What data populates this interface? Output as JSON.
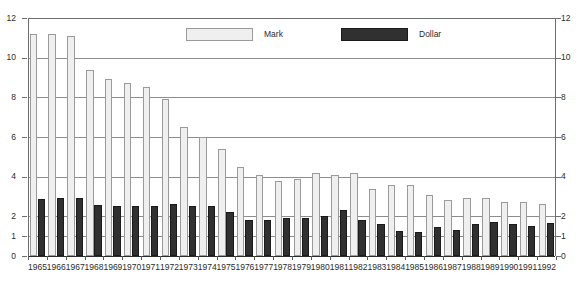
{
  "chart_data": {
    "type": "bar",
    "title": "",
    "subtitle": "",
    "xlabel": "",
    "ylabel": "",
    "ylim": [
      0,
      12
    ],
    "grid": true,
    "legend_position": "top-center",
    "y_ticks": [
      "0",
      "1",
      "2",
      "4",
      "6",
      "8",
      "10",
      "12"
    ],
    "y_tick_values": [
      0,
      1,
      2,
      4,
      6,
      8,
      10,
      12
    ],
    "dual_axis": true,
    "categories": [
      "1965",
      "1966",
      "1967",
      "1968",
      "1969",
      "1970",
      "1971",
      "1972",
      "1973",
      "1974",
      "1975",
      "1976",
      "1977",
      "1978",
      "1979",
      "1980",
      "1981",
      "1982",
      "1983",
      "1984",
      "1985",
      "1986",
      "1987",
      "1988",
      "1989",
      "1990",
      "1991",
      "1992"
    ],
    "series": [
      {
        "name": "Mark",
        "color": "#efefef",
        "values": [
          11.2,
          11.2,
          11.1,
          9.4,
          8.9,
          8.7,
          8.5,
          7.9,
          6.5,
          6.0,
          5.4,
          4.5,
          4.1,
          3.8,
          3.9,
          4.2,
          4.1,
          4.2,
          3.4,
          3.6,
          3.6,
          3.1,
          2.8,
          2.9,
          2.9,
          2.7,
          2.7,
          2.6
        ]
      },
      {
        "name": "Dollar",
        "color": "#303030",
        "values": [
          2.85,
          2.9,
          2.9,
          2.55,
          2.5,
          2.5,
          2.5,
          2.6,
          2.5,
          2.5,
          2.2,
          1.8,
          1.8,
          1.9,
          1.9,
          2.0,
          2.3,
          1.8,
          1.6,
          1.25,
          1.2,
          1.45,
          1.3,
          1.6,
          1.7,
          1.6,
          1.5,
          1.65
        ]
      }
    ]
  },
  "legend": {
    "entries": [
      {
        "label": "Mark",
        "swatch": "mark"
      },
      {
        "label": "Dollar",
        "swatch": "dollar"
      }
    ]
  }
}
